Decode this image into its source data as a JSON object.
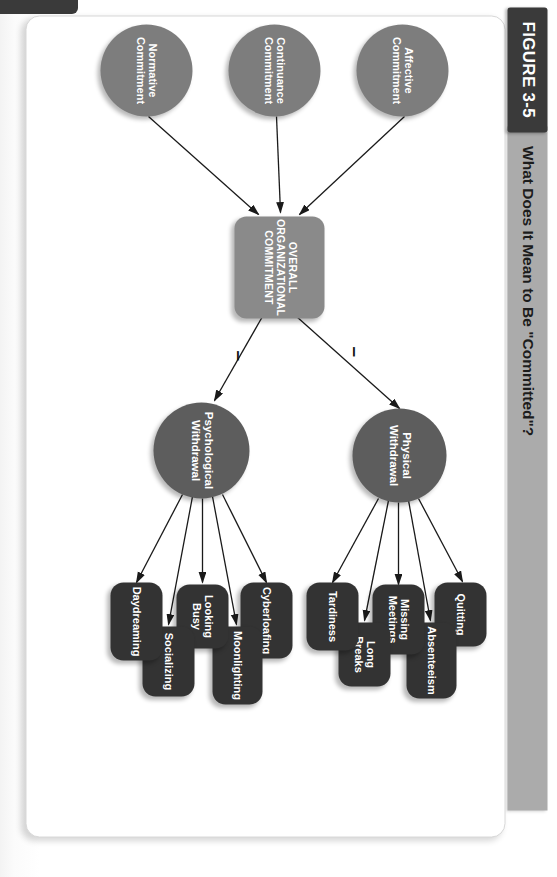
{
  "figure": {
    "tag": "FIGURE 3-5",
    "title": "What Does It Mean to Be \"Committed\"?"
  },
  "colors": {
    "tag_bg": "#3a3a3a",
    "title_bar_bg": "#ababab",
    "commitment_circle": "#7d7d7d",
    "withdrawal_circle": "#5d5d5d",
    "core_box": "#8a8a8a",
    "outcome_pill": "#333333",
    "connector": "#1a1a1a",
    "page_bg": "#ffffff"
  },
  "diagram": {
    "type": "flow-diagram",
    "antecedents": [
      {
        "id": "affective",
        "label": "Affective\nCommitment"
      },
      {
        "id": "continuance",
        "label": "Continuance\nCommitment"
      },
      {
        "id": "normative",
        "label": "Normative\nCommitment"
      }
    ],
    "core": {
      "id": "overall",
      "label": "OVERALL\nORGANIZATIONAL\nCOMMITMENT"
    },
    "mediators": [
      {
        "id": "physical",
        "label": "Physical\nWithdrawal"
      },
      {
        "id": "psychological",
        "label": "Psychological\nWithdrawal"
      }
    ],
    "physical_outcomes": [
      {
        "id": "quitting",
        "label": "Quitting"
      },
      {
        "id": "absenteeism",
        "label": "Absenteeism"
      },
      {
        "id": "missing-meetings",
        "label": "Missing\nMeetings"
      },
      {
        "id": "long-breaks",
        "label": "Long\nBreaks"
      },
      {
        "id": "tardiness",
        "label": "Tardiness"
      }
    ],
    "psychological_outcomes": [
      {
        "id": "cyberloafing",
        "label": "Cyberloafing"
      },
      {
        "id": "moonlighting",
        "label": "Moonlighting"
      },
      {
        "id": "looking-busy",
        "label": "Looking\nBusy"
      },
      {
        "id": "socializing",
        "label": "Socializing"
      },
      {
        "id": "daydreaming",
        "label": "Daydreaming"
      }
    ],
    "edge_signs": [
      {
        "id": "sign-physical",
        "symbol": "–",
        "from": "overall",
        "to": "physical"
      },
      {
        "id": "sign-psychological",
        "symbol": "–",
        "from": "overall",
        "to": "psychological"
      }
    ]
  }
}
